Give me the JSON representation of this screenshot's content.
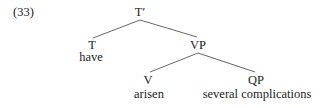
{
  "example_number": "(33)",
  "tree": {
    "root": {
      "label": "T′"
    },
    "nodes": {
      "t": {
        "label": "T",
        "word": "have"
      },
      "vp": {
        "label": "VP"
      },
      "v": {
        "label": "V",
        "word": "arisen"
      },
      "qp": {
        "label": "QP",
        "word": "several complications"
      }
    },
    "edges": [
      [
        "T′",
        "T"
      ],
      [
        "T′",
        "VP"
      ],
      [
        "VP",
        "V"
      ],
      [
        "VP",
        "QP"
      ]
    ]
  }
}
